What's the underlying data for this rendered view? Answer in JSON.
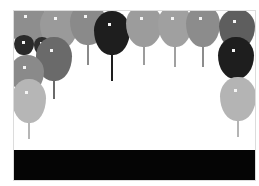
{
  "scene": {
    "title": "balloon-pop-game",
    "background": "#ffffff",
    "bottom_bar_color": "#050505"
  },
  "balloons": [
    {
      "x": -4,
      "y": -8,
      "w": 38,
      "h": 44,
      "color": "#8e8e8e",
      "string_len": 0
    },
    {
      "x": 26,
      "y": -6,
      "w": 38,
      "h": 44,
      "color": "#9a9a9a",
      "string_len": 0
    },
    {
      "x": 56,
      "y": -8,
      "w": 36,
      "h": 42,
      "color": "#8a8a8a",
      "string_len": 22
    },
    {
      "x": 80,
      "y": 0,
      "w": 36,
      "h": 44,
      "color": "#1e1e1e",
      "string_len": 28
    },
    {
      "x": 112,
      "y": -6,
      "w": 36,
      "h": 42,
      "color": "#9c9c9c",
      "string_len": 20
    },
    {
      "x": 144,
      "y": -6,
      "w": 34,
      "h": 42,
      "color": "#a0a0a0",
      "string_len": 22
    },
    {
      "x": 172,
      "y": -6,
      "w": 34,
      "h": 42,
      "color": "#8c8c8c",
      "string_len": 22
    },
    {
      "x": 205,
      "y": -2,
      "w": 36,
      "h": 40,
      "color": "#5e5e5e",
      "string_len": 0
    },
    {
      "x": 0,
      "y": 24,
      "w": 20,
      "h": 20,
      "color": "#2a2a2a",
      "string_len": 0
    },
    {
      "x": 20,
      "y": 26,
      "w": 16,
      "h": 18,
      "color": "#2e2e2e",
      "string_len": 0
    },
    {
      "x": 22,
      "y": 26,
      "w": 36,
      "h": 44,
      "color": "#6a6a6a",
      "string_len": 20
    },
    {
      "x": -4,
      "y": 44,
      "w": 34,
      "h": 38,
      "color": "#8a8a8a",
      "string_len": 0
    },
    {
      "x": -2,
      "y": 68,
      "w": 34,
      "h": 44,
      "color": "#b6b6b6",
      "string_len": 18
    },
    {
      "x": 204,
      "y": 26,
      "w": 36,
      "h": 42,
      "color": "#1e1e1e",
      "string_len": 20
    },
    {
      "x": 206,
      "y": 66,
      "w": 36,
      "h": 44,
      "color": "#b4b4b4",
      "string_len": 18
    }
  ]
}
